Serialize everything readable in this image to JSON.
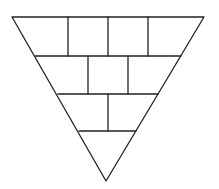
{
  "diagram": {
    "title": "Inverted triangle divided into rows of cells",
    "stroke_color": "#222222",
    "background": "#ffffff",
    "triangle": {
      "top_left": [
        12,
        17
      ],
      "top_right": [
        204,
        17
      ],
      "apex": [
        106,
        181
      ]
    },
    "rows": [
      {
        "y_top": 17,
        "y_bottom": 56,
        "cells": 4,
        "dividers_x": [
          68,
          108,
          148
        ]
      },
      {
        "y_top": 56,
        "y_bottom": 94,
        "cells": 3,
        "dividers_x": [
          88,
          128
        ]
      },
      {
        "y_top": 94,
        "y_bottom": 131,
        "cells": 2,
        "dividers_x": [
          108
        ]
      },
      {
        "y_top": 131,
        "y_bottom": 181,
        "cells": 1,
        "dividers_x": []
      }
    ],
    "horizontal_lines": [
      {
        "y": 56,
        "x1": 35,
        "x2": 181
      },
      {
        "y": 94,
        "x1": 58,
        "x2": 158
      },
      {
        "y": 131,
        "x1": 79,
        "x2": 136
      }
    ]
  }
}
